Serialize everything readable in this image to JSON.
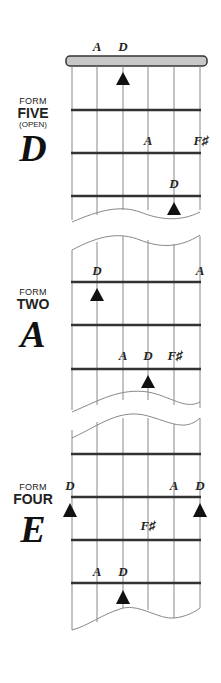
{
  "forms": [
    {
      "word": "FORM",
      "number": "FIVE",
      "sub": "(OPEN)",
      "key": "D"
    },
    {
      "word": "FORM",
      "number": "TWO",
      "sub": "",
      "key": "A"
    },
    {
      "word": "FORM",
      "number": "FOUR",
      "sub": "",
      "key": "E"
    }
  ],
  "notes": [
    {
      "label": "A",
      "x": 97,
      "y": 51
    },
    {
      "label": "D",
      "x": 123,
      "y": 51
    },
    {
      "label": "A",
      "x": 148,
      "y": 145
    },
    {
      "label": "F♯",
      "x": 201,
      "y": 145
    },
    {
      "label": "D",
      "x": 174,
      "y": 188
    },
    {
      "label": "D",
      "x": 97,
      "y": 275
    },
    {
      "label": "A",
      "x": 200,
      "y": 275
    },
    {
      "label": "A",
      "x": 123,
      "y": 360
    },
    {
      "label": "D",
      "x": 148,
      "y": 360
    },
    {
      "label": "F♯",
      "x": 175,
      "y": 360
    },
    {
      "label": "D",
      "x": 70,
      "y": 490
    },
    {
      "label": "A",
      "x": 174,
      "y": 490
    },
    {
      "label": "D",
      "x": 200,
      "y": 490
    },
    {
      "label": "F♯",
      "x": 148,
      "y": 530
    },
    {
      "label": "A",
      "x": 97,
      "y": 576
    },
    {
      "label": "D",
      "x": 123,
      "y": 576
    }
  ],
  "colors": {
    "line": "#333333",
    "nut": "#c8c8c8",
    "string": "#888888"
  }
}
